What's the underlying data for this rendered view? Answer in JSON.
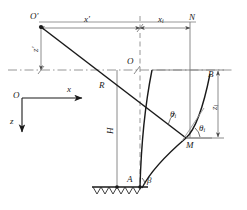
{
  "diagram": {
    "colors": {
      "stroke_thin": "#7a7a7a",
      "stroke_main": "#1a1a1a",
      "dash": "#8a8a8a",
      "ground": "#3a3a3a"
    },
    "labels": {
      "origin_prime": "O",
      "origin_prime_mark": "′",
      "origin": "O",
      "point_n": "N",
      "point_r": "R",
      "point_a": "A",
      "point_b": "B",
      "point_m": "M",
      "dim_x_prime": "x",
      "dim_x_prime_mark": "′",
      "dim_xi": "x",
      "dim_xi_sub": "i",
      "dim_z_prime": "z",
      "dim_z_prime_mark": "′",
      "dim_zi": "z",
      "dim_zi_sub": "i",
      "dim_h": "H",
      "axis_x": "x",
      "axis_z": "z",
      "angle_theta_i_upper": "θ",
      "angle_theta_i_upper_sub": "i",
      "angle_theta_i_lower": "θ",
      "angle_theta_i_lower_sub": "i",
      "angle_beta": "β"
    }
  }
}
